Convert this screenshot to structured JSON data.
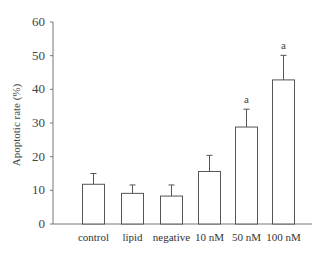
{
  "chart_data": {
    "type": "bar",
    "title": "",
    "xlabel": "",
    "ylabel": "Apoptotic rate (%)",
    "ylim": [
      0,
      60
    ],
    "yticks": [
      0,
      10,
      20,
      30,
      40,
      50,
      60
    ],
    "grid": false,
    "legend": null,
    "categories": [
      "control",
      "lipid",
      "negative",
      "10 nM",
      "50 nM",
      "100 nM"
    ],
    "values": [
      11.8,
      9.1,
      8.3,
      15.6,
      28.8,
      42.8
    ],
    "error": [
      3.2,
      2.5,
      3.3,
      4.8,
      5.3,
      7.3
    ],
    "annotations": [
      "",
      "",
      "",
      "",
      "a",
      "a"
    ]
  }
}
